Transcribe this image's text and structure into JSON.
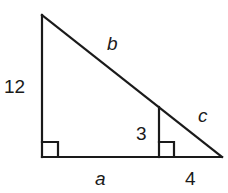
{
  "diagram": {
    "type": "similar-right-triangles",
    "labels": {
      "left_side": "12",
      "hypotenuse_upper": "b",
      "hypotenuse_lower": "c",
      "inner_height": "3",
      "base_left": "a",
      "base_right": "4"
    },
    "stroke_color": "#1a1a1a",
    "background": "#ffffff"
  }
}
